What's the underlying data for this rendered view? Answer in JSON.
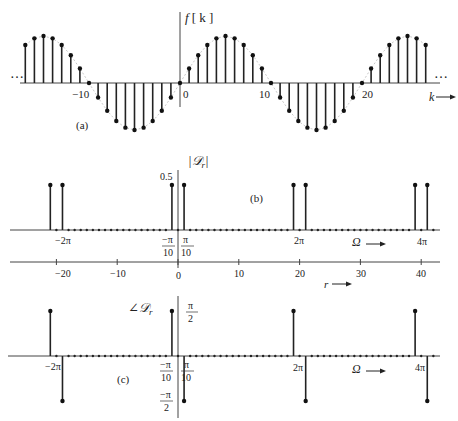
{
  "chart_data": [
    {
      "id": "a",
      "type": "stem",
      "panel_label": "(a)",
      "title": "",
      "ylabel": "f [k]",
      "xlabel": "k",
      "x_ticks": [
        -10,
        0,
        10,
        20
      ],
      "ellipsis": "…",
      "formula": "f[k] = sin(pi k / 10)",
      "x": [
        -20,
        -19,
        -18,
        -17,
        -16,
        -15,
        -14,
        -13,
        -12,
        -11,
        -10,
        -9,
        -8,
        -7,
        -6,
        -5,
        -4,
        -3,
        -2,
        -1,
        0,
        1,
        2,
        3,
        4,
        5,
        6,
        7,
        8,
        9,
        10,
        11,
        12,
        13,
        14,
        15,
        16,
        17,
        18,
        19,
        20,
        21,
        22,
        23,
        24,
        25,
        26,
        27
      ],
      "values": [
        0,
        0.31,
        0.59,
        0.81,
        0.95,
        1.0,
        0.95,
        0.81,
        0.59,
        0.31,
        0,
        -0.31,
        -0.59,
        -0.81,
        -0.95,
        -1.0,
        -0.95,
        -0.81,
        -0.59,
        -0.31,
        0,
        0.31,
        0.59,
        0.81,
        0.95,
        1.0,
        0.95,
        0.81,
        0.59,
        0.31,
        0,
        -0.31,
        -0.59,
        -0.81,
        -0.95,
        -1.0,
        -0.95,
        -0.81,
        -0.59,
        -0.31,
        0,
        0.31,
        0.59,
        0.81,
        0.95,
        1.0,
        0.95,
        0.81
      ],
      "visible_k_range": [
        -17,
        27
      ]
    },
    {
      "id": "b",
      "type": "stem",
      "panel_label": "(b)",
      "ylabel": "|D_r|",
      "ytick": "0.5",
      "xlabel": "Ω",
      "omega_ticks": [
        "-2π",
        "-π/10",
        "π/10",
        "2π",
        "4π"
      ],
      "r_axis": {
        "label": "r",
        "ticks": [
          -20,
          -10,
          0,
          10,
          20,
          30,
          40
        ]
      },
      "r": [
        -21,
        -19,
        -1,
        1,
        19,
        21,
        39,
        41
      ],
      "values": [
        0.5,
        0.5,
        0.5,
        0.5,
        0.5,
        0.5,
        0.5,
        0.5
      ],
      "other_r_values": 0,
      "r_range": [
        -21,
        42
      ]
    },
    {
      "id": "c",
      "type": "stem",
      "panel_label": "(c)",
      "ylabel": "∠D_r",
      "yticks": [
        "π/2",
        "-π/2"
      ],
      "xlabel": "Ω",
      "omega_ticks": [
        "-2π",
        "-π/10",
        "π/10",
        "2π",
        "4π"
      ],
      "r": [
        -21,
        -19,
        -1,
        1,
        19,
        21,
        39,
        41
      ],
      "values": [
        "π/2",
        "-π/2",
        "π/2",
        "-π/2",
        "π/2",
        "-π/2",
        "π/2",
        "-π/2"
      ],
      "values_numeric": [
        1.5708,
        -1.5708,
        1.5708,
        -1.5708,
        1.5708,
        -1.5708,
        1.5708,
        -1.5708
      ],
      "other_r_values": 0
    }
  ],
  "labels": {
    "a_ylabel_f": "f",
    "a_ylabel_k": "[ k ]",
    "a_xlabel": "k",
    "a_panel": "(a)",
    "a_tick_m10": "−10",
    "a_tick_0": "0",
    "a_tick_10": "10",
    "a_tick_20": "20",
    "ellipsis": "…",
    "b_ylabel": "|𝒟",
    "b_ylabel_sub": "r",
    "b_ylabel_end": "|",
    "b_ytick": "0.5",
    "b_panel": "(b)",
    "omega": "Ω",
    "m2pi": "−2π",
    "pi": "π",
    "mpi": "−π",
    "ten": "10",
    "two": "2",
    "twopi": "2π",
    "fourpi": "4π",
    "r_label": "r",
    "r_m20": "−20",
    "r_m10": "−10",
    "r_0": "0",
    "r_10": "10",
    "r_20": "20",
    "r_30": "30",
    "r_40": "40",
    "c_ylabel": "∠𝒟",
    "c_ylabel_sub": "r",
    "c_panel": "(c)"
  }
}
